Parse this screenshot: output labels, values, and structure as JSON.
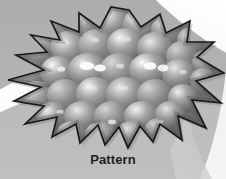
{
  "figure": {
    "caption": "Pattern",
    "alt_description": "Grayscale starburst shape filled with a bumpy clustered-sphere texture",
    "width": 226,
    "height": 179,
    "colors": {
      "background_upper": "#b0b0b0",
      "background_lower": "#bdbdbd",
      "swoosh_white": "#fbfbfb",
      "star_outline": "#1a1a1a",
      "star_fill_dark": "#6f6f6f",
      "star_fill_mid": "#8a8a8a",
      "star_fill_light": "#c8c8c8",
      "star_highlight": "#ffffff",
      "caption_color": "#1d1d1d"
    },
    "shapes": {
      "star": {
        "name": "starburst",
        "points": "129,10 141,27 160,14 166,33 190,21 187,42 214,42 197,57 224,73 196,81 221,103 192,100 206,128 178,116 182,140 160,124 153,142 140,126 128,148 119,127 105,145 98,125 80,143 76,124 52,137 57,117 25,124 44,106 14,101 41,87 8,80 44,70 16,55 47,52 31,35 60,40 51,21 79,32 79,13 100,28 111,7"
      },
      "swoosh_left": {
        "name": "left-white-band",
        "path": "M -6,95 C 18,80 44,66 78,60 L 92,86 C 60,90 28,98 -6,114 Z"
      },
      "swoosh_top_right": {
        "name": "top-right-white-sweep",
        "path": "M 150,-6 L 236,-6 L 236,56 C 210,42 186,26 163,6 Z"
      },
      "corner_bottom_right": {
        "name": "bottom-right-light-corner",
        "path": "M 186,179 L 226,179 L 226,118 C 214,140 202,161 186,179 Z"
      }
    },
    "texture": {
      "name": "bumpy-sphere-cluster",
      "bump_count": 42,
      "description": "Overlapping shaded spheres with specular highlights"
    }
  }
}
